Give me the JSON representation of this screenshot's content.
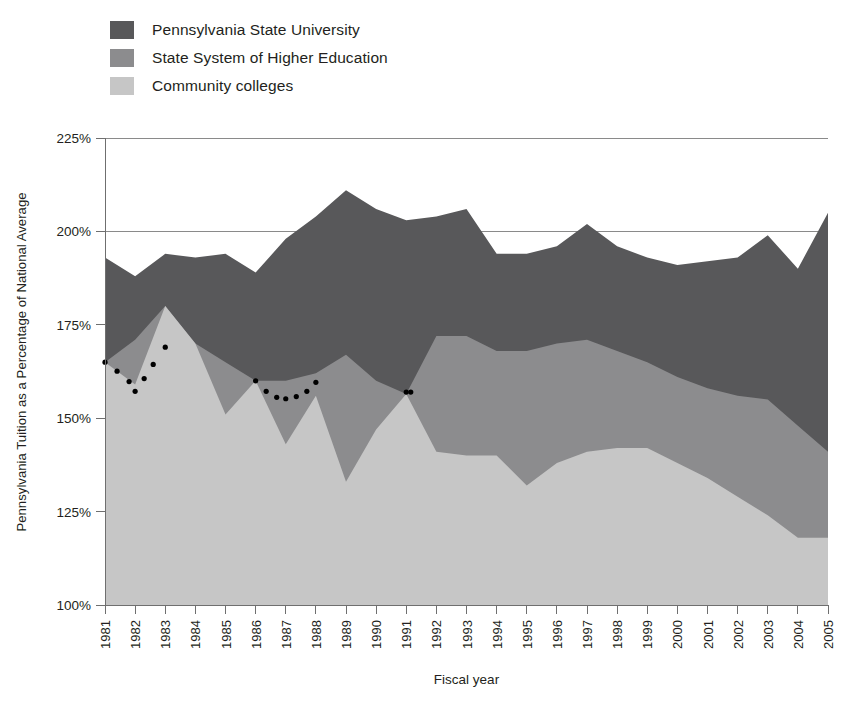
{
  "chart_data": {
    "type": "area",
    "stacked": true,
    "title": "",
    "xlabel": "Fiscal year",
    "ylabel": "Pennsylvania Tuition as a Percentage of National Average",
    "ylim": [
      100,
      225
    ],
    "yticks": [
      100,
      125,
      150,
      175,
      200,
      225
    ],
    "ytick_labels": [
      "100%",
      "125%",
      "150%",
      "175%",
      "200%",
      "225%"
    ],
    "grid": true,
    "grid_axis": "y",
    "legend_position": "top-left",
    "categories": [
      1981,
      1982,
      1983,
      1984,
      1985,
      1986,
      1987,
      1988,
      1989,
      1990,
      1991,
      1992,
      1993,
      1994,
      1995,
      1996,
      1997,
      1998,
      1999,
      2000,
      2001,
      2002,
      2003,
      2004,
      2005
    ],
    "xtick_labels": [
      "1981",
      "1982",
      "1983",
      "1984",
      "1985",
      "1986",
      "1987",
      "1988",
      "1989",
      "1990",
      "1991",
      "1992",
      "1993",
      "1994",
      "1995",
      "1996",
      "1997",
      "1998",
      "1999",
      "2000",
      "2001",
      "2002",
      "2003",
      "2004",
      "2005"
    ],
    "series": [
      {
        "name": "Community colleges",
        "color": "#c6c6c6",
        "cumulative_top": [
          165.0,
          159.0,
          180.0,
          170.0,
          151.0,
          160.0,
          143.0,
          156.0,
          133.0,
          147.0,
          156.5,
          141.0,
          140.0,
          140.0,
          132.0,
          138.0,
          141.0,
          142.0,
          142.0,
          138.0,
          134.0,
          129.0,
          124.0,
          118.0,
          118.0
        ],
        "values": [
          65.0,
          59.0,
          80.0,
          70.0,
          51.0,
          60.0,
          43.0,
          56.0,
          33.0,
          47.0,
          56.5,
          41.0,
          40.0,
          40.0,
          32.0,
          38.0,
          41.0,
          42.0,
          42.0,
          38.0,
          34.0,
          29.0,
          24.0,
          18.0,
          18.0
        ]
      },
      {
        "name": "State System of Higher Education",
        "color": "#8c8c8e",
        "cumulative_top": [
          165.0,
          171.0,
          180.0,
          170.0,
          165.0,
          160.0,
          160.0,
          162.0,
          167.0,
          160.0,
          156.5,
          172.0,
          172.0,
          168.0,
          168.0,
          170.0,
          171.0,
          168.0,
          165.0,
          161.0,
          158.0,
          156.0,
          155.0,
          148.0,
          141.0
        ],
        "values": [
          0.0,
          12.0,
          0.0,
          0.0,
          14.0,
          0.0,
          17.0,
          6.0,
          34.0,
          13.0,
          0.0,
          31.0,
          32.0,
          28.0,
          36.0,
          32.0,
          30.0,
          26.0,
          23.0,
          23.0,
          24.0,
          27.0,
          31.0,
          30.0,
          23.0
        ]
      },
      {
        "name": "Pennsylvania State University",
        "color": "#58585a",
        "cumulative_top": [
          193.0,
          188.0,
          194.0,
          193.0,
          194.0,
          189.0,
          198.0,
          204.0,
          211.0,
          206.0,
          203.0,
          204.0,
          206.0,
          194.0,
          194.0,
          196.0,
          202.0,
          196.0,
          193.0,
          191.0,
          192.0,
          193.0,
          199.0,
          190.0,
          205.0
        ],
        "values": [
          28.0,
          17.0,
          14.0,
          23.0,
          29.0,
          29.0,
          38.0,
          42.0,
          44.0,
          46.0,
          46.5,
          32.0,
          34.0,
          26.0,
          26.0,
          26.0,
          31.0,
          28.0,
          28.0,
          30.0,
          34.0,
          37.0,
          44.0,
          42.0,
          64.0
        ]
      }
    ],
    "annotation_series": {
      "name": "dotted-overlay",
      "style": "dotted",
      "color": "#000000",
      "segments": [
        {
          "x": [
            1981,
            1981.4,
            1981.8,
            1982,
            1982.3,
            1982.6,
            1983
          ],
          "y": [
            165.0,
            162.6,
            159.8,
            157.2,
            160.6,
            164.4,
            169.0
          ]
        },
        {
          "x": [
            1986,
            1986.35,
            1986.7,
            1987,
            1987.35,
            1987.7,
            1988
          ],
          "y": [
            160.0,
            157.2,
            155.6,
            155.2,
            155.8,
            157.2,
            159.6
          ]
        },
        {
          "x": [
            1991,
            1991.15
          ],
          "y": [
            157.0,
            157.0
          ]
        }
      ]
    }
  },
  "legend": {
    "items": [
      {
        "label": "Pennsylvania State University",
        "swatch": "#58585a"
      },
      {
        "label": "State System of Higher Education",
        "swatch": "#8c8c8e"
      },
      {
        "label": "Community colleges",
        "swatch": "#c6c6c6"
      }
    ]
  },
  "axes": {
    "y_title": "Pennsylvania Tuition as a Percentage of National Average",
    "x_title": "Fiscal year"
  }
}
